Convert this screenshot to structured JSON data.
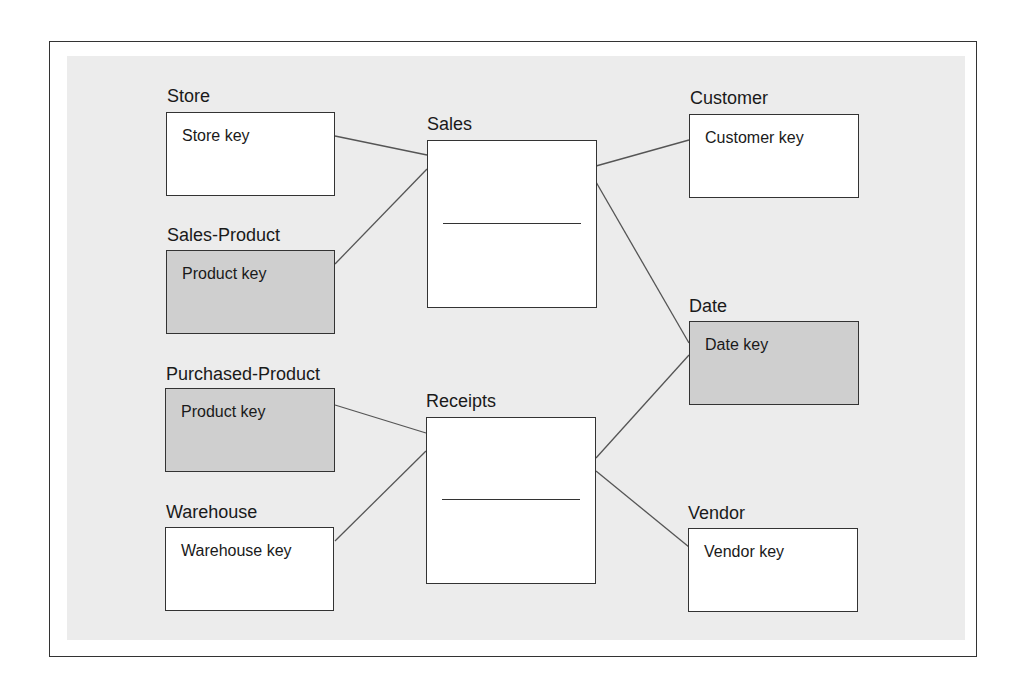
{
  "diagram": {
    "type": "star-schema",
    "colors": {
      "frame_border": "#333333",
      "panel_background": "#ececec",
      "box_fill": "#ffffff",
      "shared_dimension_fill": "#cfcfcf",
      "line_color": "#555555"
    },
    "fact_tables": [
      {
        "id": "sales",
        "label": "Sales"
      },
      {
        "id": "receipts",
        "label": "Receipts"
      }
    ],
    "dimensions": [
      {
        "id": "store",
        "label": "Store",
        "key": "Store key",
        "shaded": false,
        "linked_to": [
          "sales"
        ]
      },
      {
        "id": "sales-product",
        "label": "Sales-Product",
        "key": "Product key",
        "shaded": true,
        "linked_to": [
          "sales"
        ]
      },
      {
        "id": "purchased-product",
        "label": "Purchased-Product",
        "key": "Product key",
        "shaded": true,
        "linked_to": [
          "receipts"
        ]
      },
      {
        "id": "warehouse",
        "label": "Warehouse",
        "key": "Warehouse key",
        "shaded": false,
        "linked_to": [
          "receipts"
        ]
      },
      {
        "id": "customer",
        "label": "Customer",
        "key": "Customer key",
        "shaded": false,
        "linked_to": [
          "sales"
        ]
      },
      {
        "id": "date",
        "label": "Date",
        "key": "Date key",
        "shaded": true,
        "linked_to": [
          "sales",
          "receipts"
        ]
      },
      {
        "id": "vendor",
        "label": "Vendor",
        "key": "Vendor key",
        "shaded": false,
        "linked_to": [
          "receipts"
        ]
      }
    ]
  }
}
